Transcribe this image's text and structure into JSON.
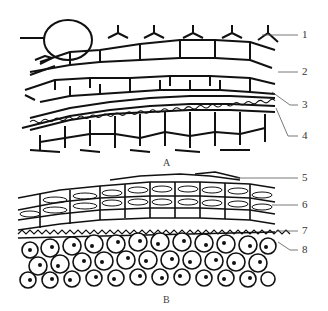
{
  "figure": {
    "panels": [
      {
        "id": "A",
        "caption": "A",
        "labels": [
          {
            "number": "1",
            "x": 302,
            "y": 35
          },
          {
            "number": "2",
            "x": 302,
            "y": 72
          },
          {
            "number": "3",
            "x": 302,
            "y": 105
          },
          {
            "number": "4",
            "x": 302,
            "y": 136
          }
        ]
      },
      {
        "id": "B",
        "caption": "B",
        "labels": [
          {
            "number": "5",
            "x": 302,
            "y": 178
          },
          {
            "number": "6",
            "x": 302,
            "y": 205
          },
          {
            "number": "7",
            "x": 302,
            "y": 231
          },
          {
            "number": "8",
            "x": 302,
            "y": 250
          }
        ]
      }
    ]
  }
}
